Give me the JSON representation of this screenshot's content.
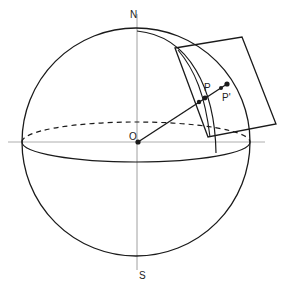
{
  "diagram": {
    "type": "sphere-projection",
    "labels": {
      "north": "N",
      "south": "S",
      "origin": "O",
      "point": "P",
      "projected_point": "P'"
    },
    "colors": {
      "stroke": "#1a1a1a",
      "axis": "#888888",
      "background": "#ffffff"
    }
  }
}
